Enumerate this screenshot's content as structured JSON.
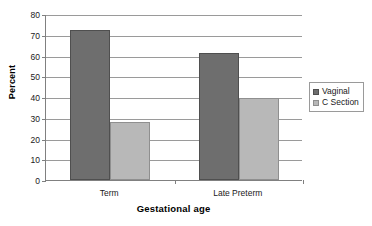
{
  "chart_data": {
    "type": "bar",
    "title": "",
    "xlabel": "Gestational age",
    "ylabel": "Percent",
    "categories": [
      "Term",
      "Late Preterm"
    ],
    "series": [
      {
        "name": "Vaginal",
        "values": [
          72.5,
          61.0
        ],
        "color": "#6e6e6e"
      },
      {
        "name": "C Section",
        "values": [
          28.0,
          39.5
        ],
        "color": "#b8b8b8"
      }
    ],
    "ylim": [
      0,
      80
    ],
    "yticks": [
      0,
      10,
      20,
      30,
      40,
      50,
      60,
      70,
      80
    ],
    "ytick_labels": [
      "0",
      "10",
      "20",
      "30",
      "40",
      "50",
      "60",
      "70",
      "80"
    ],
    "grid": true,
    "grid_axis": "y",
    "legend_position": "right",
    "legend_border": true
  },
  "axes": {
    "y_title": "Percent",
    "x_title": "Gestational age"
  },
  "legend": {
    "items": [
      {
        "label": "Vaginal"
      },
      {
        "label": "C Section"
      }
    ]
  }
}
